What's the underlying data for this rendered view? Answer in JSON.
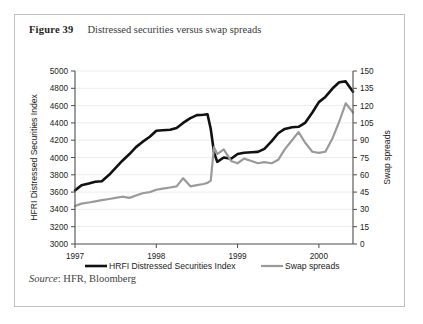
{
  "caption": {
    "figure_number": "Figure 39",
    "title": "Distressed securities versus swap spreads"
  },
  "source": {
    "label": "Source",
    "text": ": HFR, Bloomberg"
  },
  "legend": [
    {
      "name": "hrfi-distressed-securities-index",
      "label": "HRFI Distressed Securities Index",
      "color": "#111111",
      "width": 2.6
    },
    {
      "name": "swap-spreads",
      "label": "Swap spreads",
      "color": "#9a9a9a",
      "width": 2.2
    }
  ],
  "chart_data": {
    "type": "line",
    "title": "Distressed securities versus swap spreads",
    "xlabel": "",
    "ylabel": "HFRI Distressed Securities Index",
    "y2label": "Swap spreads",
    "grid": true,
    "legend_position": "bottom",
    "xlim": [
      1997,
      2000.42
    ],
    "xticks": [
      1997,
      1998,
      1999,
      2000
    ],
    "xtick_labels": [
      "1997",
      "1998",
      "1999",
      "2000"
    ],
    "ylim": [
      3000,
      5000
    ],
    "yticks": [
      3000,
      3200,
      3400,
      3600,
      3800,
      4000,
      4200,
      4400,
      4600,
      4800,
      5000
    ],
    "ytick_labels": [
      "3000",
      "3200",
      "3400",
      "3600",
      "3800",
      "4000",
      "4200",
      "4400",
      "4600",
      "4800",
      "5000"
    ],
    "y2lim": [
      0,
      150
    ],
    "y2ticks": [
      0,
      15,
      30,
      45,
      60,
      75,
      90,
      105,
      120,
      135,
      150
    ],
    "y2tick_labels": [
      "0",
      "15",
      "30",
      "45",
      "60",
      "75",
      "90",
      "105",
      "120",
      "135",
      "150"
    ],
    "series": [
      {
        "name": "HRFI Distressed Securities Index",
        "axis": "left",
        "color": "#111111",
        "x": [
          1997.0,
          1997.08,
          1997.17,
          1997.25,
          1997.33,
          1997.42,
          1997.5,
          1997.58,
          1997.67,
          1997.75,
          1997.83,
          1997.92,
          1998.0,
          1998.08,
          1998.17,
          1998.25,
          1998.33,
          1998.42,
          1998.5,
          1998.58,
          1998.63,
          1998.67,
          1998.71,
          1998.75,
          1998.83,
          1998.92,
          1999.0,
          1999.08,
          1999.17,
          1999.25,
          1999.33,
          1999.42,
          1999.5,
          1999.58,
          1999.67,
          1999.75,
          1999.83,
          1999.92,
          2000.0,
          2000.08,
          2000.17,
          2000.25,
          2000.33,
          2000.42
        ],
        "y": [
          3620,
          3680,
          3700,
          3720,
          3725,
          3800,
          3880,
          3960,
          4040,
          4120,
          4180,
          4240,
          4310,
          4315,
          4320,
          4340,
          4400,
          4455,
          4490,
          4495,
          4500,
          4330,
          4060,
          3950,
          4000,
          3985,
          4040,
          4055,
          4060,
          4065,
          4100,
          4190,
          4280,
          4330,
          4350,
          4355,
          4400,
          4520,
          4640,
          4700,
          4800,
          4870,
          4880,
          4760
        ],
        "marker": null,
        "linewidth": 2.6
      },
      {
        "name": "Swap spreads",
        "axis": "right",
        "color": "#9a9a9a",
        "x": [
          1997.0,
          1997.08,
          1997.17,
          1997.25,
          1997.33,
          1997.42,
          1997.5,
          1997.58,
          1997.67,
          1997.75,
          1997.83,
          1997.92,
          1998.0,
          1998.08,
          1998.17,
          1998.25,
          1998.33,
          1998.42,
          1998.5,
          1998.58,
          1998.63,
          1998.67,
          1998.71,
          1998.75,
          1998.83,
          1998.92,
          1999.0,
          1999.08,
          1999.17,
          1999.25,
          1999.33,
          1999.42,
          1999.5,
          1999.58,
          1999.67,
          1999.75,
          1999.83,
          1999.92,
          2000.0,
          2000.08,
          2000.17,
          2000.25,
          2000.33,
          2000.42
        ],
        "y": [
          33,
          35,
          36,
          37,
          38,
          39,
          40,
          41,
          40,
          42,
          44,
          45,
          47,
          48,
          49,
          50,
          57,
          50,
          51,
          52,
          53,
          55,
          84,
          78,
          82,
          72,
          70,
          74,
          72,
          70,
          71,
          70,
          73,
          82,
          90,
          97,
          88,
          80,
          79,
          80,
          92,
          106,
          122,
          114
        ],
        "marker": null,
        "linewidth": 2.2
      }
    ]
  }
}
